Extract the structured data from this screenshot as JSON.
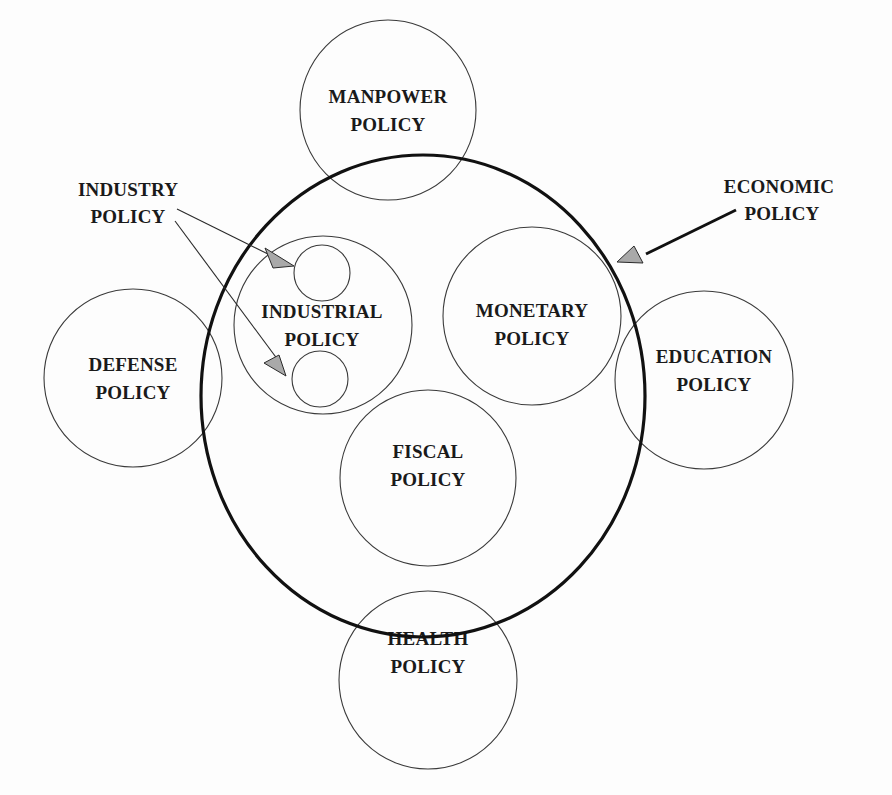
{
  "diagram": {
    "type": "policy-relationship-circles",
    "container": {
      "label": "ECONOMIC POLICY",
      "label_lines": [
        "ECONOMIC",
        "POLICY"
      ]
    },
    "nodes": {
      "manpower": {
        "lines": [
          "MANPOWER",
          "POLICY"
        ]
      },
      "industrial": {
        "lines": [
          "INDUSTRIAL",
          "POLICY"
        ]
      },
      "monetary": {
        "lines": [
          "MONETARY",
          "POLICY"
        ]
      },
      "defense": {
        "lines": [
          "DEFENSE",
          "POLICY"
        ]
      },
      "education": {
        "lines": [
          "EDUCATION",
          "POLICY"
        ]
      },
      "fiscal": {
        "lines": [
          "FISCAL",
          "POLICY"
        ]
      },
      "health": {
        "lines": [
          "HEALTH",
          "POLICY"
        ]
      }
    },
    "callouts": {
      "industry": {
        "lines": [
          "INDUSTRY",
          "POLICY"
        ],
        "targets": 2
      },
      "economic": {
        "lines": [
          "ECONOMIC",
          "POLICY"
        ],
        "targets": 1
      }
    },
    "colors": {
      "background": "#fdfdfd",
      "stroke": "#111111",
      "arrowhead_fill": "#a9a9a9",
      "text": "#1a1a1a"
    }
  }
}
